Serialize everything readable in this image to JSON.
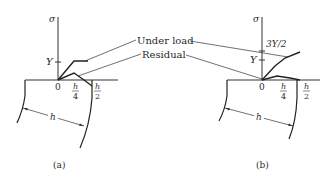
{
  "figure": {
    "callouts": {
      "under_load": "Under load",
      "residual": "Residual"
    },
    "panels": [
      {
        "id": "a",
        "caption": "(a)",
        "axis_label": "σ",
        "y_ticks": [
          "Y"
        ],
        "x_ticks": {
          "origin": "0",
          "quarter_num": "h",
          "quarter_den": "4",
          "half_num": "h",
          "half_den": "2"
        },
        "width_label": "h"
      },
      {
        "id": "b",
        "caption": "(b)",
        "axis_label": "σ",
        "y_ticks": [
          "3Y/2",
          "Y"
        ],
        "x_ticks": {
          "origin": "0",
          "quarter_num": "h",
          "quarter_den": "4",
          "half_num": "h",
          "half_den": "2"
        },
        "width_label": "h"
      }
    ]
  }
}
